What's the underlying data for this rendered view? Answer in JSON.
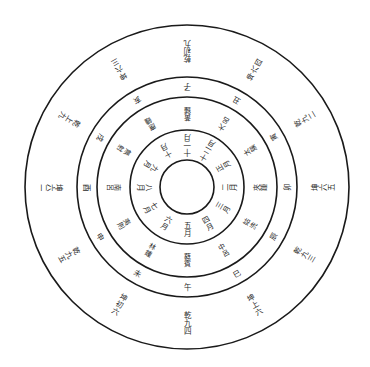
{
  "diagram": {
    "title": "",
    "center": {
      "x": 187,
      "y": 187
    },
    "rings": [
      {
        "name": "inner-circle",
        "radius": 27
      },
      {
        "name": "month-ring",
        "radius": 57
      },
      {
        "name": "pitch-ring",
        "radius": 90
      },
      {
        "name": "branch-ring",
        "radius": 110
      },
      {
        "name": "outer-circle",
        "radius": 162
      }
    ],
    "layers": [
      {
        "name": "months",
        "radius": 42,
        "font_size": 7.5,
        "labels": [
          "十一月",
          "十二月",
          "正月",
          "二月",
          "三月",
          "四月",
          "五月",
          "六月",
          "七月",
          "八月",
          "九月",
          "十月"
        ]
      },
      {
        "name": "pitch-pipes",
        "radius": 73,
        "font_size": 7,
        "labels": [
          "黃鍾",
          "大呂",
          "太簇",
          "夾鍾",
          "姑洗",
          "中呂",
          "蕤賓",
          "林鍾",
          "夷則",
          "南呂",
          "無射",
          "應鍾"
        ]
      },
      {
        "name": "earthly-branches",
        "radius": 100,
        "font_size": 7.5,
        "labels": [
          "子",
          "丑",
          "寅",
          "卯",
          "辰",
          "巳",
          "午",
          "未",
          "申",
          "酉",
          "戌",
          "亥"
        ]
      },
      {
        "name": "hexagram-lines",
        "radius": 136,
        "font_size": 7.5,
        "labels": [
          "乾初九",
          "坤六四",
          "乾九二",
          "坤六五",
          "乾九三",
          "坤上六",
          "乾九四",
          "坤初六",
          "乾九五",
          "坤六二",
          "乾上九",
          "坤六三"
        ]
      }
    ]
  }
}
